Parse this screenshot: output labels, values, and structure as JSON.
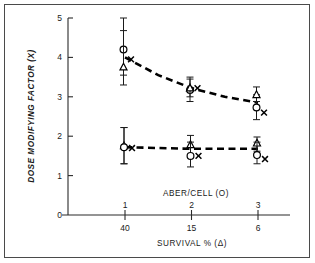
{
  "chart_data": {
    "type": "scatter",
    "title": "",
    "ylabel": "DOSE MODIFYING FACTOR (X)",
    "ylim": [
      0,
      5
    ],
    "yticks": [
      0,
      1,
      2,
      3,
      4,
      5
    ],
    "ytick_labels": [
      "0",
      "1",
      "2",
      "3",
      "4",
      "5"
    ],
    "grid": false,
    "legend_position": "none",
    "x_axis_top": {
      "label": "ABER/CELL (O)",
      "tick_labels": [
        "1",
        "2",
        "3"
      ]
    },
    "x_axis_bottom": {
      "label": "SURVIVAL % (Δ)",
      "tick_labels": [
        "40",
        "15",
        "6"
      ]
    },
    "x": [
      1,
      2,
      3
    ],
    "series": [
      {
        "name": "upper-circle",
        "symbol": "circle",
        "values": [
          4.2,
          3.17,
          2.73
        ],
        "err_low": [
          3.3,
          2.88,
          2.42
        ],
        "err_high": [
          5.0,
          3.45,
          3.05
        ]
      },
      {
        "name": "upper-triangle",
        "symbol": "triangle",
        "values": [
          3.75,
          3.22,
          3.05
        ],
        "err_low": [
          3.55,
          3.0,
          2.88
        ],
        "err_high": [
          4.68,
          3.5,
          3.25
        ]
      },
      {
        "name": "upper-x",
        "symbol": "x",
        "values": [
          3.95,
          3.22,
          2.6
        ],
        "err_low": [],
        "err_high": []
      },
      {
        "name": "lower-triangle",
        "symbol": "triangle",
        "values": [
          1.75,
          1.78,
          1.82
        ],
        "err_low": [
          1.3,
          1.52,
          1.62
        ],
        "err_high": [
          2.22,
          2.02,
          1.98
        ]
      },
      {
        "name": "lower-circle",
        "symbol": "circle",
        "values": [
          1.72,
          1.5,
          1.52
        ],
        "err_low": [
          1.3,
          1.22,
          1.3
        ],
        "err_high": [
          2.22,
          1.85,
          1.85
        ]
      },
      {
        "name": "lower-x",
        "symbol": "x",
        "values": [
          1.7,
          1.5,
          1.42
        ],
        "err_low": [],
        "err_high": []
      }
    ],
    "trend_lines": [
      {
        "name": "upper-trend",
        "points": [
          [
            1,
            4.0
          ],
          [
            1.5,
            3.55
          ],
          [
            2,
            3.22
          ],
          [
            2.5,
            3.0
          ],
          [
            3,
            2.85
          ]
        ]
      },
      {
        "name": "lower-trend",
        "points": [
          [
            1,
            1.72
          ],
          [
            2,
            1.68
          ],
          [
            3,
            1.68
          ]
        ]
      }
    ]
  }
}
